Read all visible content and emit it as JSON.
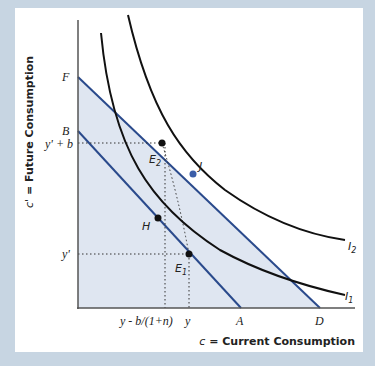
{
  "axes": {
    "y_title_var": "c'",
    "y_title_rest": " = Future Consumption",
    "x_title_var": "c",
    "x_title_rest": " = Current Consumption"
  },
  "y_ticks": {
    "F": "F",
    "B": "B",
    "yb": "y' + b",
    "yp": "y'"
  },
  "x_ticks": {
    "ybn": "y - b/(1+n)",
    "y": "y",
    "A": "A",
    "D": "D"
  },
  "points": {
    "E2": "E",
    "E2_sub": "2",
    "E1": "E",
    "E1_sub": "1",
    "J": "J",
    "H": "H"
  },
  "curves": {
    "I1": "I",
    "I1_sub": "1",
    "I2": "I",
    "I2_sub": "2"
  },
  "colors": {
    "budget_line": "#2a4a8c",
    "indifference": "#111111",
    "shade": "#dfe6f1",
    "point_J": "#3c5ea8",
    "border": "#c7d5e2"
  }
}
